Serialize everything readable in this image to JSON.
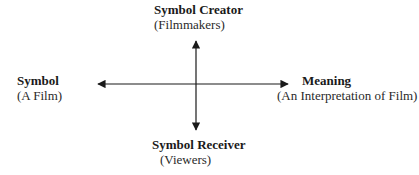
{
  "diagram": {
    "top": {
      "title": "Symbol Creator",
      "subtitle": "(Filmmakers)"
    },
    "left": {
      "title": "Symbol",
      "subtitle": "(A Film)"
    },
    "right": {
      "title": "Meaning",
      "subtitle": "(An Interpretation of Film)"
    },
    "bottom": {
      "title": "Symbol Receiver",
      "subtitle": "(Viewers)"
    },
    "colors": {
      "stroke": "#1a1a1a",
      "background": "#ffffff"
    }
  }
}
